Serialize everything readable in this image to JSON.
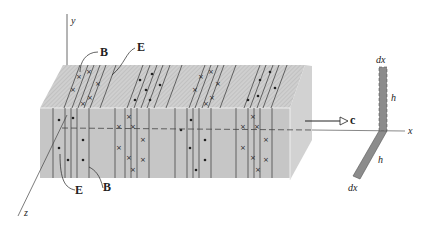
{
  "figure": {
    "axes": {
      "x": "x",
      "y": "y",
      "z": "z"
    },
    "labels": {
      "B_top": "B",
      "E_top": "E",
      "E_front": "E",
      "B_front": "B",
      "velocity": "c",
      "loop_width_top": "dx",
      "loop_height_upper": "h",
      "loop_height_lower": "h",
      "loop_width_bottom": "dx"
    },
    "symbols": {
      "out_of_page": "•",
      "into_page": "×"
    },
    "colors": {
      "slab_top": "#c9c9c9",
      "slab_front": "#c4c4c4",
      "slab_side": "#d3d3d3",
      "loop_fill": "#8c8c8c",
      "line": "#333333"
    }
  }
}
